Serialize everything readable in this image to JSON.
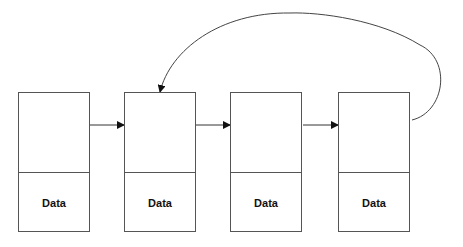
{
  "diagram": {
    "type": "circular-linked-list",
    "nodes": [
      {
        "label": "Data"
      },
      {
        "label": "Data"
      },
      {
        "label": "Data"
      },
      {
        "label": "Data"
      }
    ],
    "edges": [
      {
        "from": 0,
        "to": 1
      },
      {
        "from": 1,
        "to": 2
      },
      {
        "from": 2,
        "to": 3
      },
      {
        "from": 3,
        "to": 1,
        "curved": true
      }
    ],
    "colors": {
      "line": "#333333",
      "border": "#555555"
    }
  }
}
